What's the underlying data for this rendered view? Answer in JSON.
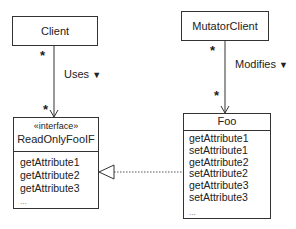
{
  "diagram": {
    "type": "UML class diagram",
    "classes": {
      "client": {
        "name": "Client"
      },
      "mutator_client": {
        "name": "MutatorClient"
      },
      "readonly_interface": {
        "stereotype": "«interface»",
        "name": "ReadOnlyFooIF",
        "operations": [
          "getAttribute1",
          "getAttribute2",
          "getAttribute3",
          "..."
        ]
      },
      "foo": {
        "name": "Foo",
        "operations": [
          "getAttribute1",
          "setAttribute1",
          "getAttribute2",
          "setAttribute2",
          "getAttribute3",
          "setAttribute3",
          "..."
        ]
      }
    },
    "associations": {
      "uses": {
        "label": "Uses",
        "direction_icon": "▼",
        "source_multiplicity": "*",
        "target_multiplicity": "*"
      },
      "modifies": {
        "label": "Modifies",
        "direction_icon": "▼",
        "source_multiplicity": "*",
        "target_multiplicity": "*"
      }
    },
    "realization": {
      "from": "Foo",
      "to": "ReadOnlyFooIF",
      "style": "dashed with hollow triangle"
    }
  }
}
